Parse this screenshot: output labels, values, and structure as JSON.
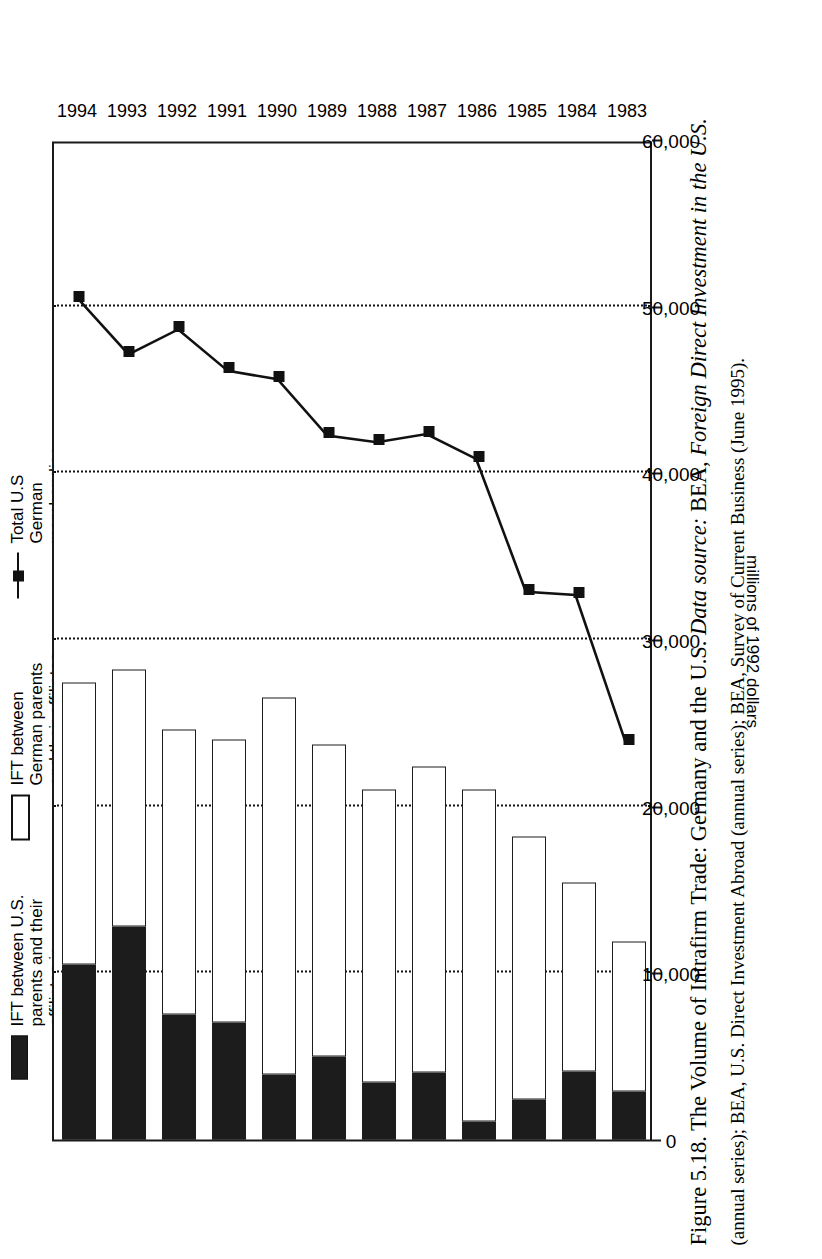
{
  "figure": {
    "caption_number": "Figure 5.18.",
    "caption_title": "The Volume of Intrafirm Trade: Germany and the U.S.",
    "caption_source_label": "Data source:",
    "caption_source_1": "BEA,",
    "caption_source_1_italic": "Foreign Direct Investment in the U.S.",
    "caption_source_1_tail": "(annual series); BEA,",
    "caption_source_2_italic": "U.S. Direct Investment Abroad",
    "caption_source_2_tail": "(annual series); BEA,",
    "caption_source_3_italic": "Survey of Current Business",
    "caption_source_3_tail": "(June 1995)."
  },
  "legend": {
    "position": "top",
    "entries": [
      {
        "name": "ift-us-parents",
        "swatch": "dark-filled-rect",
        "label": "IFT between U.S.\nparents and their\naffiliates in\nGermany"
      },
      {
        "name": "ift-german-parents",
        "swatch": "white-outlined-rect",
        "label": "IFT between\nGerman parents\nand their affiliates\nin the U.S."
      },
      {
        "name": "total-trade",
        "swatch": "line-with-square-marker",
        "label": "Total U.S\nGerman\nmerchandise\ntrade"
      }
    ]
  },
  "axes": {
    "value_axis_title": "millions of 1992 dollars",
    "value_ticks": [
      "0",
      "10,000",
      "20,000",
      "30,000",
      "40,000",
      "50,000",
      "60,000"
    ],
    "category_labels": [
      "1983",
      "1984",
      "1985",
      "1986",
      "1987",
      "1988",
      "1989",
      "1990",
      "1991",
      "1992",
      "1993",
      "1994"
    ]
  },
  "colors": {
    "dark_series": "#1c1c1c",
    "light_series": "#ffffff",
    "line_series": "#111111",
    "axis": "#1a1a1a",
    "grid": "#111111",
    "background": "#ffffff"
  },
  "chart_data": {
    "type": "bar",
    "orientation": "horizontal-stacked-with-line-overlay",
    "title": "The Volume of Intrafirm Trade: Germany and the U.S.",
    "xlabel": "millions of 1992 dollars",
    "ylabel": "",
    "xlim": [
      0,
      60000
    ],
    "grid": true,
    "grid_interval": 10000,
    "legend_position": "top",
    "categories": [
      "1983",
      "1984",
      "1985",
      "1986",
      "1987",
      "1988",
      "1989",
      "1990",
      "1991",
      "1992",
      "1993",
      "1994"
    ],
    "series": [
      {
        "name": "IFT between German parents and their affiliates in the U.S.",
        "style": "white-outlined-bar-segment",
        "values": [
          9000,
          11300,
          15800,
          19900,
          18400,
          17600,
          18700,
          22600,
          17000,
          17100,
          15400,
          16900
        ]
      },
      {
        "name": "IFT between U.S. parents and their affiliates in Germany",
        "style": "dark-filled-bar-segment",
        "values": [
          2900,
          4100,
          2400,
          1100,
          4000,
          3400,
          5000,
          3900,
          7000,
          7500,
          12800,
          10500
        ]
      },
      {
        "name": "Total U.S German merchandise trade",
        "style": "line-with-square-markers",
        "values": [
          24000,
          32800,
          33000,
          41000,
          42500,
          42000,
          42400,
          45800,
          46300,
          48800,
          47300,
          50600
        ]
      }
    ]
  }
}
